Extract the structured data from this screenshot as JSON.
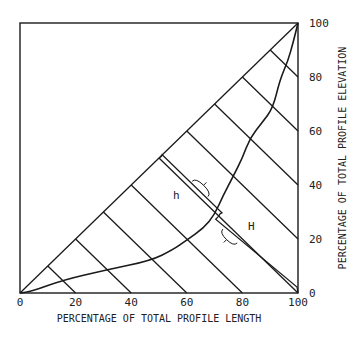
{
  "chart_data": {
    "type": "line",
    "title": "",
    "xlabel": "PERCENTAGE OF TOTAL PROFILE LENGTH",
    "ylabel": "PERCENTAGE OF TOTAL PROFILE ELEVATION",
    "xlim": [
      0,
      100
    ],
    "ylim": [
      0,
      100
    ],
    "x_ticks": [
      "0",
      "20",
      "40",
      "60",
      "80",
      "100"
    ],
    "y_ticks": [
      "0",
      "20",
      "40",
      "60",
      "80",
      "100"
    ],
    "x_tick_values": [
      0,
      20,
      40,
      60,
      80,
      100
    ],
    "y_tick_values": [
      0,
      20,
      40,
      60,
      80,
      100
    ],
    "grid": false,
    "diagonal": {
      "from": [
        0,
        0
      ],
      "to": [
        100,
        100
      ]
    },
    "perpendicular_lines_from_diagonal_at": [
      10,
      20,
      30,
      40,
      50,
      60,
      70,
      80,
      90
    ],
    "profile_curve": {
      "name": "hypsometric profile",
      "points": [
        [
          0,
          0
        ],
        [
          4,
          0.5
        ],
        [
          15.5,
          4.8
        ],
        [
          31,
          8.5
        ],
        [
          47,
          12
        ],
        [
          55,
          16
        ],
        [
          60,
          19.6
        ],
        [
          66,
          24
        ],
        [
          70,
          29
        ],
        [
          73,
          36
        ],
        [
          76.6,
          43
        ],
        [
          80,
          50
        ],
        [
          82.7,
          57.4
        ],
        [
          87,
          63
        ],
        [
          91,
          68.5
        ],
        [
          93.5,
          79
        ],
        [
          96.4,
          86
        ],
        [
          98.2,
          92.6
        ],
        [
          100,
          100
        ]
      ]
    },
    "annotations": [
      {
        "label": "h",
        "segment": "from diagonal point (50,50) to profile curve along perpendicular"
      },
      {
        "label": "H",
        "segment": "from profile curve to (100,0) along perpendicular"
      }
    ],
    "curve_crossing_on_t50": [
      71.5,
      28.5
    ]
  }
}
